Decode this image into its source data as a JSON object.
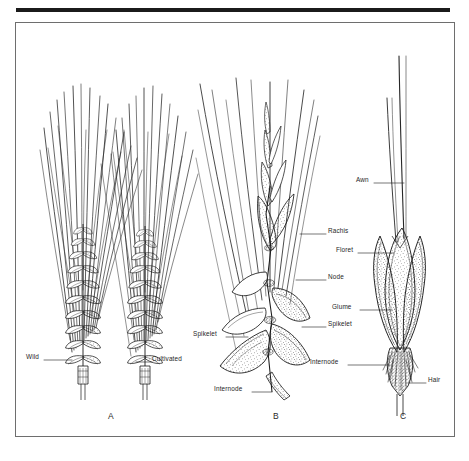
{
  "figure": {
    "type": "botanical-line-illustration",
    "background_color": "#ffffff",
    "ink_color": "#1b1b1b",
    "frame_color": "#6e6e6e"
  },
  "panels": [
    {
      "id": "A",
      "letter": "A",
      "caption_x": 108,
      "caption_y": 418,
      "description": "Two whole wheat spikes with long awns - wild form (left) and cultivated form (right)"
    },
    {
      "id": "B",
      "letter": "B",
      "caption_x": 273,
      "caption_y": 418,
      "description": "Enlarged portion of spike showing spikelets attached to rachis"
    },
    {
      "id": "C",
      "letter": "C",
      "caption_x": 400,
      "caption_y": 418,
      "description": "Single detached spikelet showing glumes, floret, awn and hairy internode"
    }
  ],
  "labels": [
    {
      "text": "Wild",
      "panel": "A",
      "x": 26,
      "y": 357,
      "align": "left",
      "leader": {
        "x1": 44,
        "y1": 360,
        "x2": 72,
        "y2": 360
      }
    },
    {
      "text": "Cultivated",
      "panel": "A",
      "x": 152,
      "y": 359,
      "align": "left",
      "leader": {
        "x1": 136,
        "y1": 362,
        "x2": 152,
        "y2": 362
      }
    },
    {
      "text": "Rachis",
      "panel": "B",
      "x": 328,
      "y": 231,
      "align": "left",
      "leader": {
        "x1": 300,
        "y1": 234,
        "x2": 326,
        "y2": 234
      }
    },
    {
      "text": "Node",
      "panel": "B",
      "x": 328,
      "y": 277,
      "align": "left",
      "leader": {
        "x1": 296,
        "y1": 280,
        "x2": 326,
        "y2": 280
      }
    },
    {
      "text": "Spikelet",
      "panel": "B",
      "x": 328,
      "y": 324,
      "align": "left",
      "leader": {
        "x1": 302,
        "y1": 327,
        "x2": 326,
        "y2": 327
      }
    },
    {
      "text": "Spikelet",
      "panel": "B",
      "x": 193,
      "y": 334,
      "align": "left",
      "leader": {
        "x1": 226,
        "y1": 337,
        "x2": 248,
        "y2": 337
      }
    },
    {
      "text": "Internode",
      "panel": "B",
      "x": 214,
      "y": 389,
      "align": "left",
      "leader": {
        "x1": 252,
        "y1": 392,
        "x2": 272,
        "y2": 392
      }
    },
    {
      "text": "Awn",
      "panel": "C",
      "x": 356,
      "y": 180,
      "align": "left",
      "leader": {
        "x1": 374,
        "y1": 183,
        "x2": 404,
        "y2": 183
      }
    },
    {
      "text": "Floret",
      "panel": "C",
      "x": 336,
      "y": 250,
      "align": "left",
      "leader": {
        "x1": 358,
        "y1": 253,
        "x2": 394,
        "y2": 253
      }
    },
    {
      "text": "Glume",
      "panel": "C",
      "x": 332,
      "y": 307,
      "align": "left",
      "leader": {
        "x1": 360,
        "y1": 310,
        "x2": 392,
        "y2": 310
      }
    },
    {
      "text": "Internode",
      "panel": "C",
      "x": 310,
      "y": 362,
      "align": "left",
      "leader": {
        "x1": 348,
        "y1": 365,
        "x2": 390,
        "y2": 365
      }
    },
    {
      "text": "Hair",
      "panel": "C",
      "x": 428,
      "y": 380,
      "align": "left",
      "leader": {
        "x1": 408,
        "y1": 383,
        "x2": 426,
        "y2": 383
      }
    }
  ]
}
